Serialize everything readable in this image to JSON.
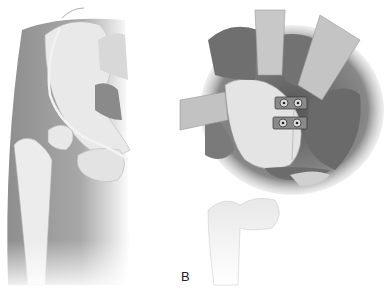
{
  "figure": {
    "panels": [
      {
        "id": "A",
        "label": "",
        "description": "Anterior view of hip: pelvis and proximal femur with incision line over thigh"
      },
      {
        "id": "B",
        "label": "B",
        "description": "Surgical exposure of hip capsule with retractors and two plates with screws"
      }
    ]
  },
  "colors": {
    "background": "#ffffff",
    "skin": "#9a9a9a",
    "bone": "#e6e6e6",
    "muscle": "#6e6e6e",
    "retractor": "#bdbdbd",
    "plate": "#7a7a7a"
  }
}
